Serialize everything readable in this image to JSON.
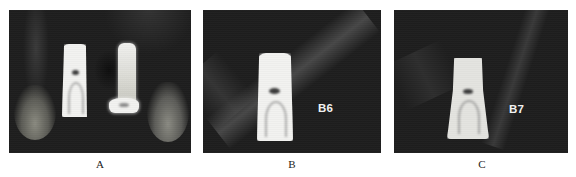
{
  "figure": {
    "panels": [
      {
        "id": "A",
        "caption": "A",
        "label": null,
        "implants": 2,
        "description": "Two dental implants between adjacent tooth roots"
      },
      {
        "id": "B",
        "caption": "B",
        "label": "B6",
        "implants": 1
      },
      {
        "id": "C",
        "caption": "C",
        "label": "B7",
        "implants": 1
      }
    ],
    "colors": {
      "background": "#ffffff",
      "scan_background": "#1e1e1e",
      "implant": "#f2f2f0",
      "caption_text": "#222222"
    }
  }
}
